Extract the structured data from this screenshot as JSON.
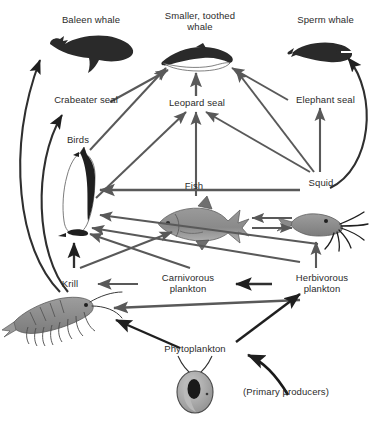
{
  "diagram": {
    "caption": "(Primary producers)",
    "colors": {
      "arrow_gray": "#595959",
      "arrow_dark": "#1a1a1a",
      "text": "#2b2b2b",
      "silhouette_dark": "#262626",
      "organism_gray": "#8c8c8c",
      "background": "#ffffff"
    },
    "nodes": [
      {
        "id": "baleen-whale",
        "label": "Baleen whale",
        "x": 36,
        "y": 14,
        "w": 110
      },
      {
        "id": "smaller-toothed-whale",
        "label": "Smaller, toothed\nwhale",
        "x": 150,
        "y": 10,
        "w": 100
      },
      {
        "id": "sperm-whale",
        "label": "Sperm whale",
        "x": 278,
        "y": 14,
        "w": 95
      },
      {
        "id": "crabeater-seal",
        "label": "Crabeater seal",
        "x": 36,
        "y": 94,
        "w": 100
      },
      {
        "id": "leopard-seal",
        "label": "Leopard seal",
        "x": 152,
        "y": 97,
        "w": 90
      },
      {
        "id": "elephant-seal",
        "label": "Elephant seal",
        "x": 278,
        "y": 94,
        "w": 95
      },
      {
        "id": "birds",
        "label": "Birds",
        "x": 50,
        "y": 134,
        "w": 56
      },
      {
        "id": "fish",
        "label": "Fish",
        "x": 172,
        "y": 180,
        "w": 44
      },
      {
        "id": "squid",
        "label": "Squid",
        "x": 295,
        "y": 177,
        "w": 52
      },
      {
        "id": "krill",
        "label": "Krill",
        "x": 48,
        "y": 278,
        "w": 44
      },
      {
        "id": "carnivorous-plankton",
        "label": "Carnivorous\nplankton",
        "x": 144,
        "y": 272,
        "w": 88
      },
      {
        "id": "herbivorous-plankton",
        "label": "Herbivorous\nplankton",
        "x": 278,
        "y": 272,
        "w": 88
      },
      {
        "id": "phytoplankton",
        "label": "Phytoplankton",
        "x": 148,
        "y": 343,
        "w": 94
      },
      {
        "id": "primary-producers",
        "label": "(Primary producers)",
        "x": 222,
        "y": 386,
        "w": 128
      }
    ],
    "links": [
      {
        "from": "krill",
        "to": "baleen-whale"
      },
      {
        "from": "krill",
        "to": "crabeater-seal"
      },
      {
        "from": "birds",
        "to": "smaller-toothed-whale"
      },
      {
        "from": "crabeater-seal",
        "to": "smaller-toothed-whale"
      },
      {
        "from": "leopard-seal",
        "to": "smaller-toothed-whale"
      },
      {
        "from": "elephant-seal",
        "to": "smaller-toothed-whale"
      },
      {
        "from": "squid",
        "to": "smaller-toothed-whale"
      },
      {
        "from": "squid",
        "to": "sperm-whale"
      },
      {
        "from": "squid",
        "to": "elephant-seal"
      },
      {
        "from": "squid",
        "to": "leopard-seal"
      },
      {
        "from": "squid",
        "to": "birds"
      },
      {
        "from": "squid",
        "to": "fish"
      },
      {
        "from": "fish",
        "to": "squid"
      },
      {
        "from": "fish",
        "to": "leopard-seal"
      },
      {
        "from": "fish",
        "to": "birds"
      },
      {
        "from": "birds",
        "to": "leopard-seal"
      },
      {
        "from": "krill",
        "to": "birds"
      },
      {
        "from": "krill",
        "to": "fish"
      },
      {
        "from": "carnivorous-plankton",
        "to": "krill"
      },
      {
        "from": "carnivorous-plankton",
        "to": "fish"
      },
      {
        "from": "herbivorous-plankton",
        "to": "carnivorous-plankton"
      },
      {
        "from": "herbivorous-plankton",
        "to": "squid"
      },
      {
        "from": "herbivorous-plankton",
        "to": "krill"
      },
      {
        "from": "phytoplankton",
        "to": "krill"
      },
      {
        "from": "phytoplankton",
        "to": "herbivorous-plankton"
      },
      {
        "from": "primary-producers",
        "to": "phytoplankton"
      }
    ]
  }
}
